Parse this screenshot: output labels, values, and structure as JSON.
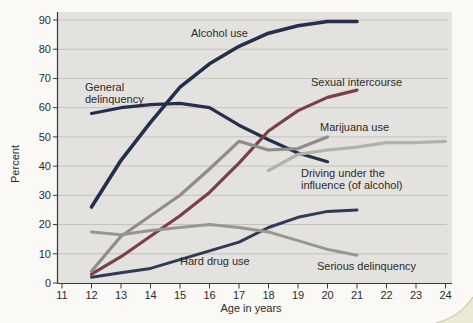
{
  "figure": {
    "ylabel": "Percent",
    "xlabel": "Age in years"
  },
  "chart_data": {
    "type": "line",
    "title": "",
    "xlabel": "Age in years",
    "ylabel": "Percent",
    "xlim": [
      11,
      24
    ],
    "ylim": [
      0,
      90
    ],
    "x_ticks": [
      11,
      12,
      13,
      14,
      15,
      16,
      17,
      18,
      19,
      20,
      21,
      22,
      23,
      24
    ],
    "y_ticks": [
      0,
      10,
      20,
      30,
      40,
      50,
      60,
      70,
      80,
      90
    ],
    "grid": "horizontal",
    "legend_position": "inline-labels",
    "plot_bg_color": "#e3e2de",
    "gridline_color": "#c4c2bc",
    "axis_color": "#3a3a3a",
    "series": [
      {
        "name": "Alcohol use",
        "color": "#242e4d",
        "width": 3.6,
        "points": [
          [
            12,
            26
          ],
          [
            13,
            42
          ],
          [
            14,
            55
          ],
          [
            15,
            67
          ],
          [
            16,
            75
          ],
          [
            17,
            81
          ],
          [
            18,
            85.5
          ],
          [
            19,
            88
          ],
          [
            20,
            89.5
          ],
          [
            21,
            89.5
          ]
        ]
      },
      {
        "name": "General delinquency",
        "color": "#242e4d",
        "width": 3.2,
        "points": [
          [
            12,
            58
          ],
          [
            13,
            60
          ],
          [
            14,
            61
          ],
          [
            15,
            61.5
          ],
          [
            16,
            60
          ],
          [
            17,
            54
          ],
          [
            18,
            49
          ],
          [
            19,
            44.5
          ],
          [
            20,
            41.5
          ]
        ]
      },
      {
        "name": "Sexual intercourse",
        "color": "#7c3e47",
        "width": 3.2,
        "points": [
          [
            12,
            3
          ],
          [
            13,
            9
          ],
          [
            14,
            16
          ],
          [
            15,
            23
          ],
          [
            16,
            31
          ],
          [
            17,
            41
          ],
          [
            18,
            52
          ],
          [
            19,
            59
          ],
          [
            20,
            63.5
          ],
          [
            21,
            66
          ]
        ]
      },
      {
        "name": "Marijuana use",
        "color": "#8e8d89",
        "width": 3.2,
        "points": [
          [
            12,
            4
          ],
          [
            13,
            16
          ],
          [
            14,
            23
          ],
          [
            15,
            30
          ],
          [
            16,
            39
          ],
          [
            17,
            48.5
          ],
          [
            18,
            45.5
          ],
          [
            19,
            46
          ],
          [
            20,
            50
          ]
        ]
      },
      {
        "name": "Driving under the influence (of alcohol)",
        "color": "#b3b1ac",
        "width": 3.2,
        "points": [
          [
            18,
            38.5
          ],
          [
            19,
            44
          ],
          [
            20,
            45.5
          ],
          [
            21,
            46.5
          ],
          [
            22,
            48
          ],
          [
            23,
            48
          ],
          [
            24,
            48.5
          ]
        ]
      },
      {
        "name": "Hard drug use",
        "color": "#2f3a59",
        "width": 3.0,
        "points": [
          [
            12,
            2
          ],
          [
            13,
            3.5
          ],
          [
            14,
            5
          ],
          [
            15,
            8
          ],
          [
            16,
            11
          ],
          [
            17,
            14
          ],
          [
            18,
            19
          ],
          [
            19,
            22.5
          ],
          [
            20,
            24.5
          ],
          [
            21,
            25
          ]
        ]
      },
      {
        "name": "Serious delinquency",
        "color": "#98968f",
        "width": 3.0,
        "points": [
          [
            12,
            17.5
          ],
          [
            13,
            16.5
          ],
          [
            14,
            18
          ],
          [
            15,
            19
          ],
          [
            16,
            20
          ],
          [
            17,
            19
          ],
          [
            18,
            17.5
          ],
          [
            19,
            14.5
          ],
          [
            20,
            11.5
          ],
          [
            21,
            9.5
          ]
        ]
      }
    ],
    "annotations": [
      {
        "name": "alcohol-use-label",
        "lines": [
          "Alcohol use"
        ],
        "x": 191,
        "y": 37
      },
      {
        "name": "general-delinquency-label",
        "lines": [
          "General",
          "delinquency"
        ],
        "x": 85,
        "y": 91
      },
      {
        "name": "sexual-intercourse-label",
        "lines": [
          "Sexual intercourse"
        ],
        "x": 311,
        "y": 86
      },
      {
        "name": "marijuana-use-label",
        "lines": [
          "Marijuana use"
        ],
        "x": 320,
        "y": 131
      },
      {
        "name": "driving-under-influence-label",
        "lines": [
          "Driving under the",
          "influence (of alcohol)"
        ],
        "x": 301,
        "y": 177
      },
      {
        "name": "hard-drug-use-label",
        "lines": [
          "Hard drug use"
        ],
        "x": 180,
        "y": 265
      },
      {
        "name": "serious-delinquency-label",
        "lines": [
          "Serious delinquency"
        ],
        "x": 317,
        "y": 270
      }
    ]
  }
}
